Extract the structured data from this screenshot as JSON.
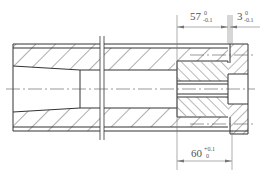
{
  "drawing": {
    "type": "mechanical-section-view",
    "line_color": "#333333",
    "dim_color": "#777777"
  },
  "dimensions": {
    "top_left": {
      "nominal": "57",
      "upper": "0",
      "lower": "-0.1"
    },
    "top_right": {
      "nominal": "3",
      "upper": "0",
      "lower": "-0.1"
    },
    "bottom": {
      "nominal": "60",
      "upper": "+0.1",
      "lower": "0"
    }
  }
}
